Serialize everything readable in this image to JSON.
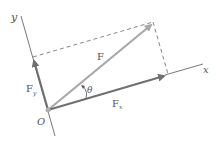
{
  "diagram": {
    "labels": {
      "y_axis": "y",
      "x_axis": "x",
      "force": "F",
      "fx_main": "F",
      "fx_sub": "x",
      "fy_main": "F",
      "fy_sub": "y",
      "angle": "θ",
      "origin": "O"
    },
    "colors": {
      "axis": "#555555",
      "component_vectors": "#707070",
      "force_vector": "#a8a8a8",
      "dashed": "#6a6a6a",
      "text": "#555555",
      "origin_dot": "#b0b0b0"
    }
  }
}
